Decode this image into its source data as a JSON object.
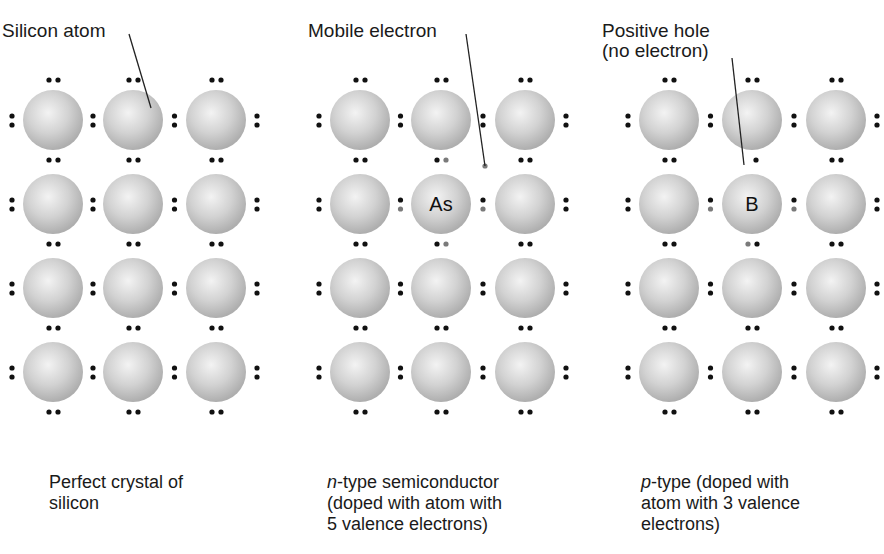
{
  "colors": {
    "background": "#ffffff",
    "atom_fill_light": "#f2f2f2",
    "atom_fill_dark": "#b4b4b4",
    "valence_electron": "#111111",
    "dopant_electron": "#7a7a7a",
    "leader_line": "#222222"
  },
  "lattice": {
    "rows_y": [
      120,
      204,
      288,
      372
    ],
    "atom_radius": 30
  },
  "panels": [
    {
      "id": "perfect-crystal",
      "columns_x": [
        53,
        133,
        216
      ],
      "callout": {
        "text": "Silicon atom",
        "label_x": 2,
        "label_y": 20,
        "line": [
          129,
          34,
          151,
          108
        ]
      },
      "dopant": null,
      "caption": {
        "prefix_italic": "",
        "line1": "Perfect crystal of",
        "line2": "silicon",
        "line3": ""
      }
    },
    {
      "id": "n-type",
      "columns_x": [
        360,
        441,
        525
      ],
      "callout": {
        "text": "Mobile electron",
        "label_x": 308,
        "label_y": 20,
        "line": [
          466,
          34,
          485,
          166
        ]
      },
      "dopant": {
        "row": 1,
        "col": 1,
        "symbol": "As",
        "valence": 5,
        "mobile_electron": [
          485,
          166
        ]
      },
      "caption": {
        "prefix_italic": "n",
        "line1": "-type semiconductor",
        "line2": "(doped with atom with",
        "line3": "5 valence electrons)"
      }
    },
    {
      "id": "p-type",
      "columns_x": [
        669,
        752,
        836
      ],
      "callout": {
        "text": "Positive hole\n(no electron)",
        "label_x": 602,
        "label_y": 20,
        "line": [
          732,
          58,
          744,
          165
        ]
      },
      "dopant": {
        "row": 1,
        "col": 1,
        "symbol": "B",
        "valence": 3,
        "hole": [
          744,
          165
        ]
      },
      "caption": {
        "prefix_italic": "p",
        "line1": "-type (doped with",
        "line2": "atom with 3 valence",
        "line3": "electrons)"
      }
    }
  ],
  "labels": {
    "silicon_atom": "Silicon atom",
    "mobile_electron": "Mobile electron",
    "positive_hole_line1": "Positive hole",
    "positive_hole_line2": "(no electron)",
    "arsenic": "As",
    "boron": "B"
  },
  "captions": {
    "perfect": {
      "line1": "Perfect crystal of",
      "line2": "silicon"
    },
    "n_type": {
      "italic": "n",
      "line1_rest": "-type semiconductor",
      "line2": "(doped with atom with",
      "line3": "5 valence electrons)"
    },
    "p_type": {
      "italic": "p",
      "line1_rest": "-type (doped with",
      "line2": "atom with 3 valence",
      "line3": "electrons)"
    }
  }
}
